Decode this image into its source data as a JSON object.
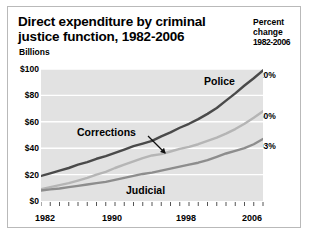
{
  "title": "Direct expenditure by criminal justice function, 1982-2006",
  "title_line1": "Direct expenditure by criminal",
  "title_line2": "justice function, 1982-2006",
  "axis_unit": "Billions",
  "percent_panel": {
    "line1": "Percent",
    "line2": "change",
    "line3": "1982-2006",
    "police": "420%",
    "corrections": "660%",
    "judicial": "503%"
  },
  "series_labels": {
    "police": "Police",
    "corrections": "Corrections",
    "judicial": "Judicial"
  },
  "colors": {
    "police": "#4a4a4a",
    "corrections": "#b5b5b5",
    "judicial": "#8d8d8d",
    "plot_background": "#e2e2e2",
    "gridline": "#ffffff",
    "border": "#b9b9b9",
    "text": "#000000"
  },
  "chart_data": {
    "type": "line",
    "title": "Direct expenditure by criminal justice function, 1982-2006",
    "xlabel": "",
    "ylabel": "Billions",
    "ylim": [
      0,
      100
    ],
    "xlim": [
      1982,
      2006
    ],
    "ytick_labels": [
      "$0",
      "$20",
      "$40",
      "$60",
      "$80",
      "$100"
    ],
    "yticks": [
      0,
      20,
      40,
      60,
      80,
      100
    ],
    "xtick_labels": [
      "1982",
      "1990",
      "1998",
      "2006"
    ],
    "xticks": [
      1982,
      1990,
      1998,
      2006
    ],
    "minor_xticks_every": 1,
    "grid": "horizontal",
    "legend": "inline-annotations",
    "x": [
      1982,
      1983,
      1984,
      1985,
      1986,
      1987,
      1988,
      1989,
      1990,
      1991,
      1992,
      1993,
      1994,
      1995,
      1996,
      1997,
      1998,
      1999,
      2000,
      2001,
      2002,
      2003,
      2004,
      2005,
      2006
    ],
    "series": [
      {
        "name": "Police",
        "color": "#4a4a4a",
        "percent_change_1982_2006": "420%",
        "values": [
          19.0,
          21.0,
          23.0,
          25.0,
          27.5,
          29.5,
          32.0,
          34.0,
          36.5,
          39.0,
          41.5,
          43.5,
          45.5,
          49.0,
          52.0,
          55.5,
          58.5,
          62.0,
          66.0,
          70.5,
          76.0,
          81.5,
          87.5,
          93.0,
          99.0
        ]
      },
      {
        "name": "Corrections",
        "color": "#b5b5b5",
        "percent_change_1982_2006": "660%",
        "values": [
          9.0,
          10.5,
          12.0,
          13.5,
          15.5,
          17.5,
          20.0,
          22.0,
          25.0,
          27.5,
          30.0,
          32.5,
          34.5,
          35.5,
          37.5,
          39.5,
          41.0,
          43.0,
          45.5,
          48.0,
          51.0,
          54.5,
          58.5,
          63.0,
          68.0
        ]
      },
      {
        "name": "Judicial",
        "color": "#8d8d8d",
        "percent_change_1982_2006": "503%",
        "values": [
          8.0,
          8.8,
          9.5,
          10.5,
          11.5,
          12.5,
          13.5,
          14.5,
          16.0,
          17.5,
          19.0,
          20.5,
          21.5,
          23.0,
          24.5,
          26.0,
          27.5,
          29.0,
          31.0,
          33.5,
          36.0,
          38.0,
          40.0,
          43.0,
          47.0
        ]
      }
    ],
    "annotations": [
      {
        "text": "Police",
        "target_series": "Police"
      },
      {
        "text": "Corrections",
        "target_series": "Corrections",
        "arrow": true
      },
      {
        "text": "Judicial",
        "target_series": "Judicial"
      }
    ]
  }
}
